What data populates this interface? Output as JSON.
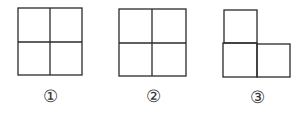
{
  "figures": [
    {
      "label": "①",
      "shape": "2x2 square grid"
    },
    {
      "label": "②",
      "shape": "2x2 square grid"
    },
    {
      "label": "③",
      "shape": "L-tromino (3 squares)"
    }
  ],
  "colors": {
    "stroke": "#2a2a2a",
    "background": "#ffffff"
  }
}
